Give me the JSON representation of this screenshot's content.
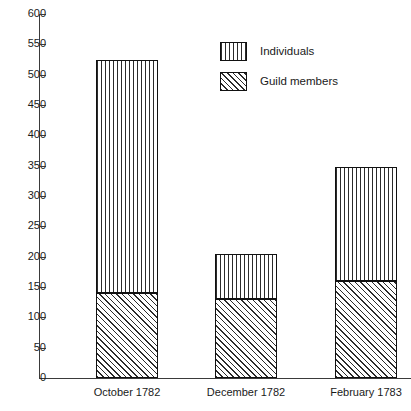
{
  "chart_data": {
    "type": "bar",
    "subtype": "stacked-vertical",
    "title": "",
    "subtitle": "",
    "xlabel": "",
    "ylabel": "",
    "categories": [
      "October 1782",
      "December 1782",
      "February 1783"
    ],
    "series": [
      {
        "name": "Guild members",
        "values": [
          140,
          130,
          160
        ],
        "pattern": "diagonal-hatch"
      },
      {
        "name": "Individuals",
        "values": [
          385,
          74,
          187
        ],
        "pattern": "vertical-lines"
      }
    ],
    "stack_totals": [
      525,
      204,
      347
    ],
    "ylim": [
      0,
      600
    ],
    "ytick_step": 50,
    "yticks": [
      0,
      50,
      100,
      150,
      200,
      250,
      300,
      350,
      400,
      450,
      500,
      550,
      600
    ],
    "ytick_labels": [
      "0",
      "50",
      "100",
      "150",
      "200",
      "250",
      "300",
      "350",
      "400",
      "450",
      "500",
      "550",
      "600"
    ],
    "grid": false,
    "legend_position": "top-center-right",
    "legend_entries": [
      "Individuals",
      "Guild members"
    ],
    "frame": "open-right-top",
    "colors": {
      "line": "#111111",
      "axis": "#3a3a3a",
      "hatch": "#2b2b2b",
      "background": "#ffffff",
      "text": "#1a1a1a"
    }
  },
  "axis": {
    "ticks": [
      {
        "label": "600",
        "value": 600
      },
      {
        "label": "550",
        "value": 550
      },
      {
        "label": "500",
        "value": 500
      },
      {
        "label": "450",
        "value": 450
      },
      {
        "label": "400",
        "value": 400
      },
      {
        "label": "350",
        "value": 350
      },
      {
        "label": "300",
        "value": 300
      },
      {
        "label": "250",
        "value": 250
      },
      {
        "label": "200",
        "value": 200
      },
      {
        "label": "150",
        "value": 150
      },
      {
        "label": "100",
        "value": 100
      },
      {
        "label": "50",
        "value": 50
      },
      {
        "label": "0",
        "value": 0
      }
    ]
  },
  "legend": {
    "items": [
      {
        "label": "Individuals",
        "pattern": "vertical-lines"
      },
      {
        "label": "Guild members",
        "pattern": "diagonal-hatch"
      }
    ]
  }
}
